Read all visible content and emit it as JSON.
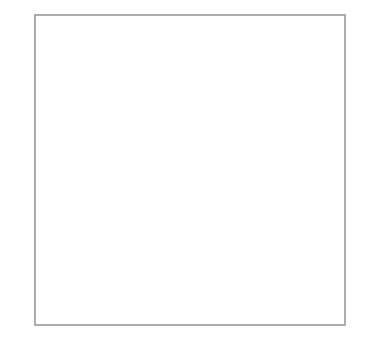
{
  "figure": {
    "type": "coordinate-plane-diagram",
    "background_color": "#ffffff",
    "grid": {
      "show": true,
      "color": "#b0b0b4",
      "border_color": "#9a9a9e",
      "x_min": -5,
      "x_max": 5,
      "y_min": -5,
      "y_max": 5,
      "cell_px": 31
    },
    "axes": {
      "color": "#111111",
      "x_axis_label": "x",
      "y_axis_label": "y",
      "origin_label": "O",
      "arrowheads": [
        "left",
        "right",
        "up",
        "down"
      ]
    },
    "x_ticks": [
      {
        "value": -4,
        "label": "−4"
      },
      {
        "value": -3,
        "label": "−3"
      },
      {
        "value": 1,
        "label": "1"
      },
      {
        "value": 2,
        "label": "2"
      },
      {
        "value": 3,
        "label": "3"
      },
      {
        "value": 4,
        "label": "4"
      }
    ],
    "y_ticks": [
      {
        "value": 1,
        "label": "1"
      },
      {
        "value": 2,
        "label": "2"
      },
      {
        "value": 3,
        "label": "3"
      },
      {
        "value": 4,
        "label": "4"
      }
    ],
    "shapes": [
      {
        "name": "upper-parallelogram",
        "kind": "parallelogram",
        "fill": "#e9e9e9",
        "stroke": "#6e6e6e",
        "stroke_width": 2.6,
        "vertices": [
          {
            "x": 0,
            "y": 4
          },
          {
            "x": 4,
            "y": 3
          },
          {
            "x": 4,
            "y": 1
          },
          {
            "x": 0,
            "y": 2
          }
        ]
      },
      {
        "name": "lower-parallelogram",
        "kind": "parallelogram",
        "fill": "#b9b9b9",
        "stroke": "#6e6e6e",
        "stroke_width": 2.6,
        "vertices": [
          {
            "x": -2,
            "y": 0
          },
          {
            "x": 0,
            "y": 0
          },
          {
            "x": -1,
            "y": -4
          },
          {
            "x": -3,
            "y": -4
          }
        ]
      }
    ]
  }
}
